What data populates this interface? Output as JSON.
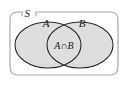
{
  "figure": {
    "type": "venn-diagram",
    "title": ""
  },
  "labels": {
    "universal_set": "S",
    "set_a": "A",
    "set_b": "B",
    "intersection_left": "A",
    "intersection_operator": "∩",
    "intersection_right": "B",
    "intersection_full": "A∩B"
  },
  "colors": {
    "background": "#ffffff",
    "shaded_fill": "#dedede",
    "outline": "#2b2b2b",
    "rect_outline": "#a8a8a8",
    "text": "#1a1a1a"
  },
  "geometry": {
    "rect": {
      "x": 10,
      "y": 12,
      "width": 108,
      "height": 63,
      "radius": 8
    },
    "ellipse_a": {
      "cx": 48,
      "cy": 45,
      "rx": 33,
      "ry": 23
    },
    "ellipse_b": {
      "cx": 80,
      "cy": 45,
      "rx": 33,
      "ry": 23
    }
  }
}
